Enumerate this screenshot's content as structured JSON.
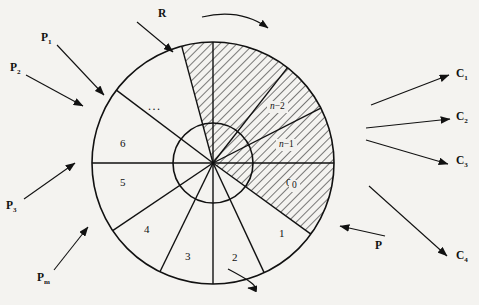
{
  "figure": {
    "center": {
      "x": 213,
      "y": 163
    },
    "outer_radius": 121,
    "inner_radius": 40,
    "background_color": "#f4f3f0",
    "line_color": "#111111",
    "hatch_color": "#111111"
  },
  "sectors": [
    {
      "id": "s0",
      "label": "0",
      "start_deg": -36,
      "end_deg": 0,
      "hatched": true,
      "label_x": 290,
      "label_y": 183
    },
    {
      "id": "s1",
      "label": "1",
      "start_deg": -65,
      "end_deg": -36,
      "hatched": false,
      "label_x": 283,
      "label_y": 234
    },
    {
      "id": "s2",
      "label": "2",
      "start_deg": -90,
      "end_deg": -65,
      "hatched": false,
      "label_x": 236,
      "label_y": 258
    },
    {
      "id": "s3",
      "label": "3",
      "start_deg": -116,
      "end_deg": -90,
      "hatched": false,
      "label_x": 189,
      "label_y": 257
    },
    {
      "id": "s4",
      "label": "4",
      "start_deg": -146,
      "end_deg": -116,
      "hatched": false,
      "label_x": 148,
      "label_y": 230
    },
    {
      "id": "s5",
      "label": "5",
      "start_deg": 180,
      "end_deg": -146,
      "hatched": false,
      "label_x": 124,
      "label_y": 183
    },
    {
      "id": "s6",
      "label": "6",
      "start_deg": 143,
      "end_deg": 180,
      "hatched": false,
      "label_x": 124,
      "label_y": 144
    },
    {
      "id": "s7",
      "label": "",
      "start_deg": 105,
      "end_deg": 143,
      "hatched": false,
      "label_x": 155,
      "label_y": 105
    },
    {
      "id": "s8",
      "label": "",
      "start_deg": 90,
      "end_deg": 105,
      "hatched": true,
      "label_x": 196,
      "label_y": 70
    },
    {
      "id": "s9",
      "label": "",
      "start_deg": 52,
      "end_deg": 90,
      "hatched": true,
      "label_x": 240,
      "label_y": 72
    },
    {
      "id": "s10",
      "label": "n-2",
      "start_deg": 27,
      "end_deg": 52,
      "hatched": true,
      "label_x": 279,
      "label_y": 105
    },
    {
      "id": "s11",
      "label": "n-1",
      "start_deg": 0,
      "end_deg": 27,
      "hatched": true,
      "label_x": 288,
      "label_y": 143
    }
  ],
  "hatched_labels": [
    {
      "name": "label-n-minus-2",
      "prefix": "n",
      "suffix": "-2",
      "x": 267,
      "y": 101
    },
    {
      "name": "label-n-minus-1",
      "prefix": "n",
      "suffix": "-1",
      "x": 276,
      "y": 139
    },
    {
      "name": "label-zero",
      "prefix": "0",
      "suffix": "",
      "x": 289,
      "y": 180
    }
  ],
  "ellipsis": {
    "text": "...",
    "x": 148,
    "y": 99
  },
  "annotations": {
    "left": [
      {
        "name": "annotation-r",
        "base": "R",
        "sub": "",
        "lx": 158,
        "ly": 8,
        "x1": 137,
        "y1": 22,
        "x2": 173,
        "y2": 52
      },
      {
        "name": "annotation-p1",
        "base": "P",
        "sub": "1",
        "lx": 41,
        "ly": 32,
        "x1": 57,
        "y1": 45,
        "x2": 104,
        "y2": 95
      },
      {
        "name": "annotation-p2",
        "base": "P",
        "sub": "2",
        "lx": 10,
        "ly": 62,
        "x1": 26,
        "y1": 75,
        "x2": 83,
        "y2": 106
      },
      {
        "name": "annotation-p3",
        "base": "P",
        "sub": "3",
        "lx": 6,
        "ly": 200,
        "x1": 24,
        "y1": 199,
        "x2": 75,
        "y2": 163
      },
      {
        "name": "annotation-pm",
        "base": "P",
        "sub": "m",
        "lx": 37,
        "ly": 272,
        "x1": 54,
        "y1": 270,
        "x2": 88,
        "y2": 227
      }
    ],
    "right": [
      {
        "name": "annotation-c1",
        "base": "C",
        "sub": "1",
        "lx": 456,
        "ly": 68,
        "x1": 371,
        "y1": 105,
        "x2": 449,
        "y2": 75
      },
      {
        "name": "annotation-c2",
        "base": "C",
        "sub": "2",
        "lx": 456,
        "ly": 111,
        "x1": 366,
        "y1": 128,
        "x2": 450,
        "y2": 119
      },
      {
        "name": "annotation-c3",
        "base": "C",
        "sub": "3",
        "lx": 456,
        "ly": 155,
        "x1": 366,
        "y1": 140,
        "x2": 448,
        "y2": 164
      },
      {
        "name": "annotation-c4",
        "base": "C",
        "sub": "4",
        "lx": 456,
        "ly": 250,
        "x1": 369,
        "y1": 186,
        "x2": 447,
        "y2": 256
      },
      {
        "name": "annotation-p",
        "base": "P",
        "sub": "",
        "lx": 375,
        "ly": 240,
        "x1": 385,
        "y1": 236,
        "x2": 340,
        "y2": 226
      }
    ]
  },
  "rotation_arrows": [
    {
      "name": "rotation-arrow-top",
      "direction": "clockwise",
      "path": "M 202 17 Q 240 8 268 28"
    },
    {
      "name": "rotation-arrow-bottom",
      "direction": "clockwise",
      "path": "M 228 269 Q 268 290 248 288"
    }
  ]
}
